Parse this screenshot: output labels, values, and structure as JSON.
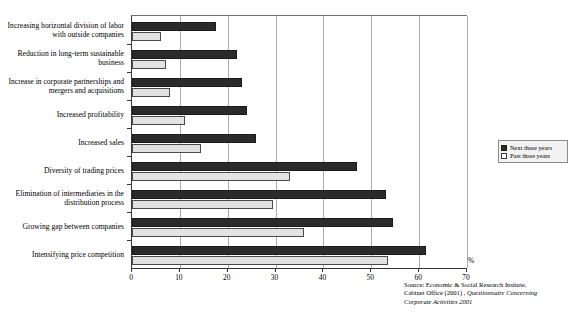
{
  "chart_data": {
    "type": "bar",
    "orientation": "horizontal",
    "title": "",
    "subtitle": "",
    "xlabel": "%",
    "ylabel": "",
    "xlim": [
      0,
      70
    ],
    "xticks": [
      0,
      10,
      20,
      30,
      40,
      50,
      60,
      70
    ],
    "grid": true,
    "legend_position": "right",
    "categories": [
      "Increasing horizontal division of labor with outside companies",
      "Reduction in long-term sustainable business",
      "Increase in corporate partnerships and mergers and acquisitions",
      "Increased profitability",
      "Increased sales",
      "Diversity of trading prices",
      "Elimination of intermediaries in the distribution process",
      "Growing gap between companies",
      "Intensifying price competition"
    ],
    "series": [
      {
        "name": "Next three years",
        "color": "#2b2b2b",
        "values": [
          17.5,
          22.0,
          23.0,
          24.0,
          26.0,
          47.0,
          53.0,
          54.5,
          61.5
        ]
      },
      {
        "name": "Past three years",
        "color": "#e2e2e2",
        "values": [
          6.0,
          7.0,
          8.0,
          11.0,
          14.5,
          33.0,
          29.5,
          36.0,
          53.5
        ]
      }
    ]
  },
  "axis": {
    "unit_label": "%",
    "tick_labels": [
      "0",
      "10",
      "20",
      "30",
      "40",
      "50",
      "60",
      "70"
    ]
  },
  "legend": {
    "items": [
      {
        "label": "Next three years",
        "swatch": "next"
      },
      {
        "label": "Past three years",
        "swatch": "past"
      }
    ]
  },
  "source": {
    "line1": "Source: Economic & Social Research Insitute,",
    "line2_plain": "Cabinet Office (2001) , ",
    "line2_italic": "Questionnaire Concerning",
    "line3_italic": "Corporate Activities 2001"
  }
}
